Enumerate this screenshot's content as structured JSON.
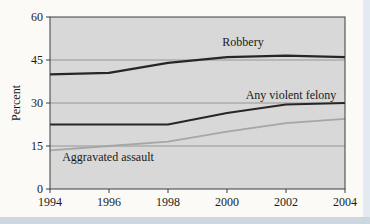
{
  "page": {
    "bg_color": "#fbfaf7",
    "window_edge_color": "#ccd7df"
  },
  "chart_data": {
    "type": "line",
    "title": "",
    "xlabel": "",
    "ylabel": "Percent",
    "xlim": [
      1994,
      2004
    ],
    "ylim": [
      0,
      60
    ],
    "x": [
      1994,
      1996,
      1998,
      2000,
      2002,
      2004
    ],
    "x_tick_labels": [
      "1994",
      "1996",
      "1998",
      "2000",
      "2002",
      "2004"
    ],
    "y_ticks": [
      0,
      15,
      30,
      45,
      60
    ],
    "y_tick_labels": [
      "0",
      "15",
      "30",
      "45",
      "60"
    ],
    "gridlines_y": [
      15,
      30,
      45
    ],
    "grid_on": true,
    "legend_position": "inline-annotations",
    "plot_bg_color": "#d8d8d8",
    "grid_color": "#8e8e8e",
    "axis_color": "#3d3d3d",
    "text_color": "#1a1a1a",
    "series": [
      {
        "name": "Robbery",
        "values": [
          40,
          40.5,
          44,
          46,
          46.5,
          46
        ],
        "color": "#262626",
        "stroke_width": 2.2,
        "label": "Robbery",
        "label_px": {
          "x": 243,
          "y": 46
        }
      },
      {
        "name": "Any violent felony",
        "values": [
          22.5,
          22.5,
          22.5,
          26.5,
          29.5,
          30
        ],
        "color": "#262626",
        "stroke_width": 2.0,
        "label": "Any violent felony",
        "label_px": {
          "x": 291,
          "y": 99
        }
      },
      {
        "name": "Aggravated assault",
        "values": [
          13.5,
          15,
          16.5,
          20,
          23,
          24.5
        ],
        "color": "#a6a6a6",
        "stroke_width": 1.8,
        "label": "Aggravated assault",
        "label_px": {
          "x": 108,
          "y": 161
        }
      }
    ]
  }
}
